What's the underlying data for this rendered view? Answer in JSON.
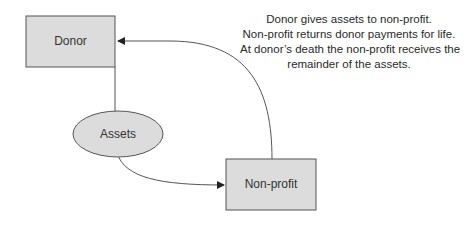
{
  "nodes": {
    "donor": {
      "label": "Donor",
      "shape": "rectangle"
    },
    "assets": {
      "label": "Assets",
      "shape": "ellipse"
    },
    "nonprofit": {
      "label": "Non-profit",
      "shape": "rectangle"
    }
  },
  "note": {
    "lines": [
      "Donor gives assets to non-profit.",
      "Non-profit returns donor payments for life.",
      "At donor’s death the non-profit receives the",
      "remainder of the assets."
    ]
  },
  "edges": [
    {
      "from": "donor",
      "to": "assets",
      "arrow": false
    },
    {
      "from": "assets",
      "to": "nonprofit",
      "arrow": true
    },
    {
      "from": "nonprofit",
      "to": "donor",
      "arrow": true
    }
  ],
  "colors": {
    "node_fill": "#dcdcdc",
    "stroke": "#555555"
  }
}
